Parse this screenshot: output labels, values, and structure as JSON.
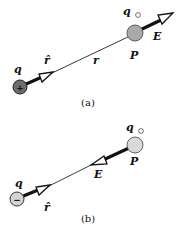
{
  "panel_a": {
    "caption": "(a)",
    "source_charge": {
      "label": "q",
      "sign": "+",
      "color": "#6e6e6e"
    },
    "unit_vector_label": "r̂",
    "distance_label": "r",
    "test_charge": {
      "label": "q",
      "subscript": "○",
      "point_label": "P",
      "color": "#a9a9a9"
    },
    "field_label": "E"
  },
  "panel_b": {
    "caption": "(b)",
    "source_charge": {
      "label": "q",
      "sign": "−",
      "color": "#d4d4d4"
    },
    "unit_vector_label": "r̂",
    "test_charge": {
      "label": "q",
      "subscript": "○",
      "point_label": "P",
      "color": "#d9d9d9"
    },
    "field_label": "E"
  }
}
